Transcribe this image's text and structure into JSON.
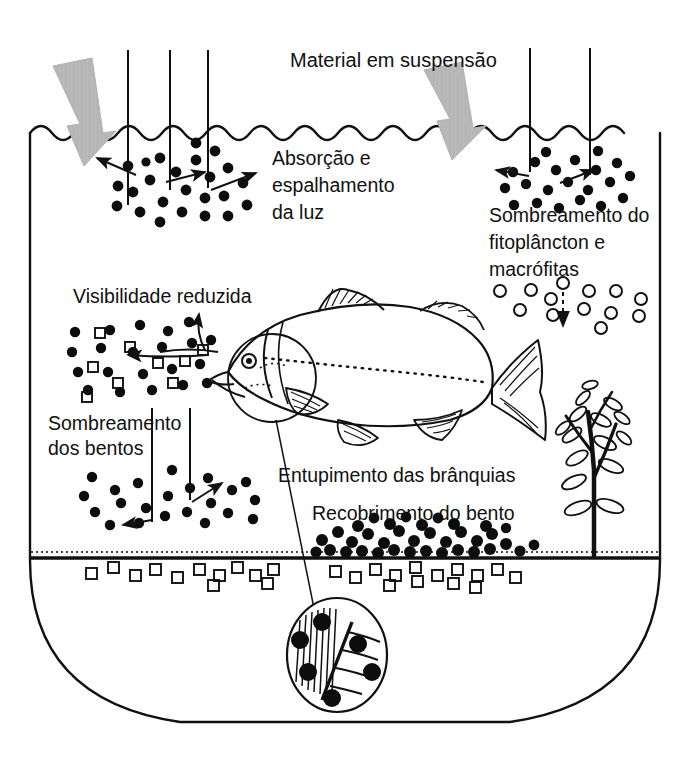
{
  "diagram": {
    "language": "pt-BR"
  },
  "labels": {
    "suspended_material": "Material em suspensão",
    "absorption_line1": "Absorção e",
    "absorption_line2": "espalhamento",
    "absorption_line3": "da luz",
    "shading_phyto_line1": "Sombreamento do",
    "shading_phyto_line2": "fitoplâncton e",
    "shading_phyto_line3": "macrófitas",
    "reduced_visibility": "Visibilidade reduzida",
    "shading_benthos_line1": "Sombreamento",
    "shading_benthos_line2": "dos bentos",
    "gill_clogging": "Entupimento das brânquias",
    "benthos_covering": "Recobrimento do bento"
  },
  "elements": {
    "vessel": "u-shaped-tank",
    "water_surface": "wavy-surface-line",
    "sediment_line": "benthic-floor-line",
    "fish": "fish-illustration",
    "macrophyte": "aquatic-plant",
    "gill_inset": "magnified-gill-detail",
    "input_arrows": "suspended-material-inflow-arrows",
    "light_rays": "sunlight-rays"
  },
  "colors": {
    "ink": "#111111",
    "particle": "#0d0d0d",
    "arrow_gray": "#b9b9b9",
    "background": "#ffffff"
  },
  "counts": {
    "light_rays_left": 3,
    "light_rays_right": 2,
    "inflow_arrows": 2
  }
}
